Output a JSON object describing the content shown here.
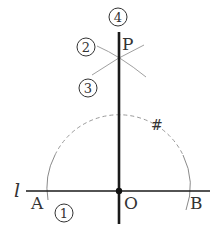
{
  "diagram": {
    "type": "geometric-construction",
    "line_label": "l",
    "points": {
      "A": "A",
      "B": "B",
      "O": "O",
      "P": "P"
    },
    "step_labels": {
      "step1": "1",
      "step2": "2",
      "step3": "3",
      "step4": "4"
    },
    "mark": "#",
    "colors": {
      "main_line": "#1a1a1a",
      "construction": "#9a9a9a",
      "text": "#333333"
    }
  }
}
